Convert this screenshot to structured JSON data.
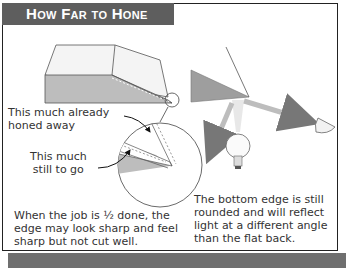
{
  "title": "How Far to Hone",
  "labels": {
    "already_honed": "This much already\nhoned away",
    "still_to_go": "This much\nstill to go"
  },
  "captions": {
    "left": "When the job is ½ done, the\nedge may look sharp and feel\nsharp but not cut well.",
    "right": "The bottom edge is still\nrounded and will reflect\nlight at a different angle\nthan the flat back."
  },
  "colors": {
    "title_bg": "#5e5e5e",
    "shadow": "#6f6f6f",
    "bevel_fill": "#a8a8a8",
    "arrow": "#8a8a8a"
  }
}
